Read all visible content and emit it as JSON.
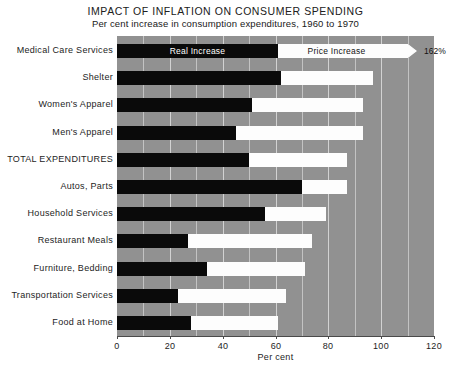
{
  "chart_data": {
    "type": "bar",
    "title": "IMPACT OF INFLATION ON CONSUMER SPENDING",
    "subtitle": "Per cent increase in consumption expenditures, 1960 to 1970",
    "xlabel": "Per cent",
    "ylabel": "",
    "xlim": [
      0,
      120
    ],
    "xticks": [
      0,
      20,
      40,
      60,
      80,
      100,
      120
    ],
    "xtick_labels": [
      "0",
      "20",
      "40",
      "60",
      "80",
      "100",
      "120"
    ],
    "gridlines_every": 10,
    "grid": true,
    "stacked": true,
    "orientation": "horizontal",
    "legend_position": "in-first-bar",
    "categories": [
      "Medical Care Services",
      "Shelter",
      "Women's Apparel",
      "Men's Apparel",
      "TOTAL EXPENDITURES",
      "Autos, Parts",
      "Household Services",
      "Restaurant Meals",
      "Furniture, Bedding",
      "Transportation Services",
      "Food at Home"
    ],
    "series": [
      {
        "name": "Real Increase",
        "color": "#0a0a0a",
        "values": [
          61,
          62,
          51,
          45,
          50,
          70,
          56,
          27,
          34,
          23,
          28
        ]
      },
      {
        "name": "Price Increase",
        "color": "#fdfdfd",
        "values": [
          101,
          35,
          42,
          48,
          37,
          17,
          23,
          47,
          37,
          41,
          33
        ]
      }
    ],
    "totals": [
      162,
      97,
      93,
      93,
      87,
      87,
      79,
      74,
      71,
      64,
      61
    ],
    "truncated_bars": [
      {
        "category": "Medical Care Services",
        "total": 162,
        "value_label": "162%",
        "drawn_to": 115,
        "break_symbol": "axis-break"
      }
    ],
    "legend": [
      {
        "label": "Real Increase",
        "color": "#0a0a0a"
      },
      {
        "label": "Price Increase",
        "color": "#fdfdfd"
      }
    ],
    "colors": {
      "plot_background": "#919191",
      "gridline": "#c3c3c3",
      "real_increase": "#0a0a0a",
      "price_increase": "#fdfdfd",
      "page_background": "#ffffff"
    }
  }
}
